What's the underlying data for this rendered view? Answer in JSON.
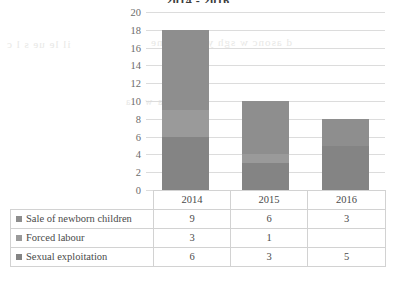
{
  "chart_data": {
    "type": "bar",
    "subtype": "stacked-column",
    "title": "2014 - 2016",
    "xlabel": "",
    "ylabel": "",
    "ylim": [
      0,
      20
    ],
    "ytick_step": 2,
    "yticks": [
      20,
      18,
      16,
      14,
      12,
      10,
      8,
      6,
      4,
      2,
      0
    ],
    "grid": true,
    "legend_position": "table-left",
    "categories": [
      "2014",
      "2015",
      "2016"
    ],
    "series": [
      {
        "name": "Sale of newborn children",
        "values": [
          9,
          6,
          3
        ],
        "color": "#8e8e8e"
      },
      {
        "name": "Forced labour",
        "values": [
          3,
          1,
          null
        ],
        "color": "#9a9a9a"
      },
      {
        "name": "Sexual exploitation",
        "values": [
          6,
          3,
          5
        ],
        "color": "#848484"
      }
    ],
    "totals": [
      18,
      10,
      8
    ],
    "cell_text": [
      [
        "9",
        "6",
        "3"
      ],
      [
        "3",
        "1",
        ""
      ],
      [
        "6",
        "3",
        "5"
      ]
    ]
  },
  "table": {
    "year_headers": [
      "2014",
      "2015",
      "2016"
    ],
    "row_labels": [
      "Sale of newborn children",
      "Forced labour",
      "Sexual exploitation"
    ]
  },
  "bleed_text": {
    "line1": "il le ue s l c",
    "line2": "d asonc w sgh  yc sn wg ne",
    "line3": "t b aw a"
  },
  "colors": {
    "series_1": "#8e8e8e",
    "series_2": "#9a9a9a",
    "series_3": "#848484",
    "gridline": "#dcdcdc",
    "table_border": "#d2d2d2",
    "text": "#4a4a4a",
    "axis_text": "#6b6b6b"
  }
}
